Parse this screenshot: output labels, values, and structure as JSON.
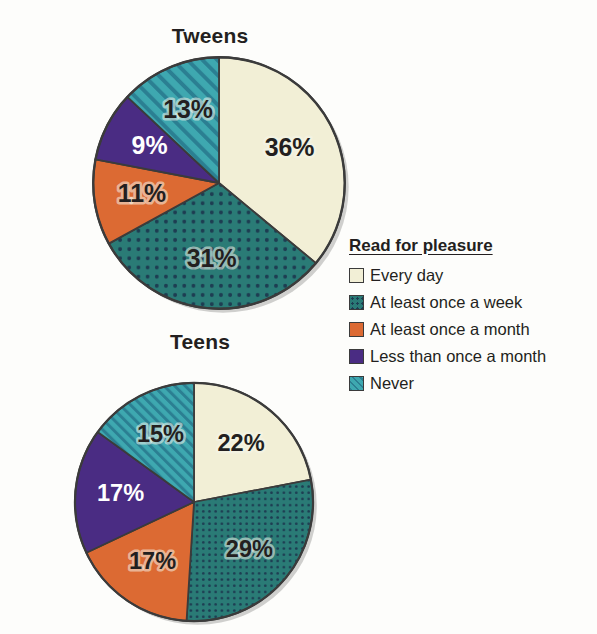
{
  "chart_data": [
    {
      "type": "pie",
      "title": "Tweens",
      "categories": [
        "Every day",
        "At least once a week",
        "At least once a month",
        "Less than once a month",
        "Never"
      ],
      "values": [
        36,
        31,
        11,
        9,
        13
      ],
      "labels": [
        "36%",
        "31%",
        "11%",
        "9%",
        "13%"
      ],
      "label_colors": [
        "dark",
        "dark",
        "dark",
        "light",
        "dark"
      ],
      "start_angle_deg": 0,
      "direction": "clockwise",
      "legend_position": "right"
    },
    {
      "type": "pie",
      "title": "Teens",
      "categories": [
        "Every day",
        "At least once a week",
        "At least once a month",
        "Less than once a month",
        "Never"
      ],
      "values": [
        22,
        29,
        17,
        17,
        15
      ],
      "labels": [
        "22%",
        "29%",
        "17%",
        "17%",
        "15%"
      ],
      "label_colors": [
        "dark",
        "dark",
        "dark",
        "light",
        "dark"
      ],
      "start_angle_deg": 0,
      "direction": "clockwise",
      "legend_position": "right"
    }
  ],
  "legend": {
    "title": "Read for pleasure",
    "items": [
      {
        "label": "Every day",
        "color": "#F2EFD6",
        "pattern": "solid"
      },
      {
        "label": "At least once a week",
        "color": "#2A7B76",
        "pattern": "dots"
      },
      {
        "label": "At least once a month",
        "color": "#DC6A33",
        "pattern": "solid"
      },
      {
        "label": "Less than once a month",
        "color": "#4A2C83",
        "pattern": "solid"
      },
      {
        "label": "Never",
        "color": "#3EA8B0",
        "pattern": "diagonal-stripes"
      }
    ]
  },
  "colors": {
    "every_day": "#F2EFD6",
    "once_a_week": "#2A7B76",
    "once_a_month": "#DC6A33",
    "less_than_month": "#4A2C83",
    "never": "#3EA8B0",
    "outline": "#3b3b3b",
    "text": "#231f20",
    "background": "#fdfdfb"
  },
  "titles": {
    "tweens": "Tweens",
    "teens": "Teens"
  }
}
